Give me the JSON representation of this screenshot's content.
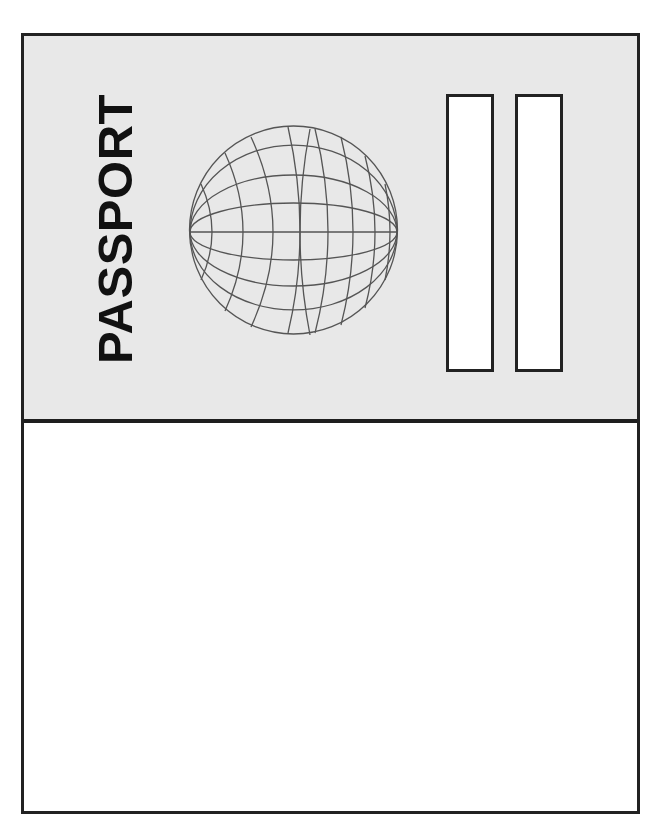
{
  "cover": {
    "title": "PASSPORT",
    "background_color": "#e8e8e8",
    "border_color": "#222222",
    "globe_icon": "globe-icon",
    "slots": [
      {
        "name": "left-slot"
      },
      {
        "name": "right-slot"
      }
    ]
  },
  "inner_page": {
    "background_color": "#ffffff"
  }
}
